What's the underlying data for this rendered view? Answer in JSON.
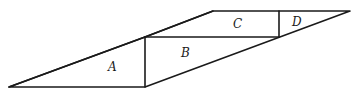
{
  "diagram": {
    "regions": [
      {
        "id": "A",
        "label": "A",
        "x": 108,
        "y": 71
      },
      {
        "id": "B",
        "label": "B",
        "x": 181,
        "y": 57
      },
      {
        "id": "C",
        "label": "C",
        "x": 233,
        "y": 28
      },
      {
        "id": "D",
        "label": "D",
        "x": 292,
        "y": 26
      }
    ],
    "colors": {
      "stroke": "#1a1a1a",
      "background": "#ffffff"
    }
  }
}
